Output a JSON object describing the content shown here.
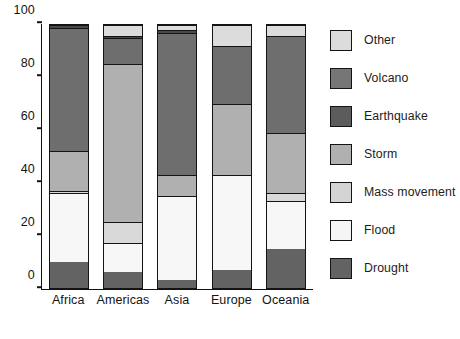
{
  "chart_data": {
    "type": "bar",
    "subtype": "stacked-bar-100-percent",
    "title": "",
    "xlabel": "",
    "ylabel": "",
    "ylim": [
      0,
      100
    ],
    "yticks": [
      0,
      20,
      40,
      60,
      80,
      100
    ],
    "ytick_labels": [
      "0",
      "20",
      "40",
      "60",
      "80",
      "100"
    ],
    "grid": false,
    "legend_position": "right",
    "stack_order_bottom_to_top": [
      "Drought",
      "Flood",
      "Mass movement",
      "Storm",
      "Earthquake",
      "Volcano",
      "Other"
    ],
    "categories": [
      "Africa",
      "Americas",
      "Asia",
      "Europe",
      "Oceania"
    ],
    "series": [
      {
        "name": "Drought",
        "color": "#636363",
        "values": [
          10,
          6,
          3,
          7,
          15
        ]
      },
      {
        "name": "Flood",
        "color": "#f7f7f7",
        "values": [
          26,
          11,
          32,
          36,
          18
        ]
      },
      {
        "name": "Mass movement",
        "color": "#d9d9d9",
        "values": [
          1,
          8,
          0,
          0,
          3
        ]
      },
      {
        "name": "Storm",
        "color": "#b0b0b0",
        "values": [
          15,
          60,
          8,
          27,
          23
        ]
      },
      {
        "name": "Earthquake",
        "color": "#6e6e6e",
        "values": [
          47,
          10,
          54,
          22,
          37
        ]
      },
      {
        "name": "Volcano",
        "color": "#4a4a4a",
        "values": [
          1,
          1,
          1,
          0,
          0
        ]
      },
      {
        "name": "Other",
        "color": "#dcdcdc",
        "values": [
          0,
          4,
          2,
          8,
          4
        ]
      }
    ]
  },
  "legend": {
    "items": [
      {
        "label": "Other",
        "color": "#dcdcdc"
      },
      {
        "label": "Volcano",
        "color": "#767676"
      },
      {
        "label": "Earthquake",
        "color": "#5c5c5c"
      },
      {
        "label": "Storm",
        "color": "#b0b0b0"
      },
      {
        "label": "Mass movement",
        "color": "#d4d4d4"
      },
      {
        "label": "Flood",
        "color": "#f5f5f5"
      },
      {
        "label": "Drought",
        "color": "#636363"
      }
    ]
  }
}
